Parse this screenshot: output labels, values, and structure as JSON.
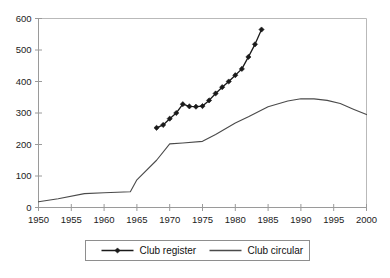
{
  "chart_data": {
    "type": "line",
    "title": "",
    "subtitle": "",
    "xlabel": "",
    "ylabel": "",
    "xlim": [
      1950,
      2000
    ],
    "ylim": [
      0,
      600
    ],
    "grid": false,
    "legend_position": "bottom",
    "x_ticks": [
      "1950",
      "1955",
      "1960",
      "1965",
      "1970",
      "1975",
      "1980",
      "1985",
      "1990",
      "1995",
      "2000"
    ],
    "x_tick_values": [
      1950,
      1955,
      1960,
      1965,
      1970,
      1975,
      1980,
      1985,
      1990,
      1995,
      2000
    ],
    "y_ticks": [
      "0",
      "100",
      "200",
      "300",
      "400",
      "500",
      "600"
    ],
    "y_tick_values": [
      0,
      100,
      200,
      300,
      400,
      500,
      600
    ],
    "series": [
      {
        "name": "Club register",
        "marker": "diamond",
        "color": "#1a1a1a",
        "x": [
          1968,
          1969,
          1970,
          1971,
          1972,
          1973,
          1974,
          1975,
          1976,
          1977,
          1978,
          1979,
          1980,
          1981,
          1982,
          1983,
          1984
        ],
        "values": [
          253,
          262,
          282,
          300,
          328,
          321,
          320,
          322,
          340,
          362,
          382,
          400,
          420,
          440,
          478,
          518,
          565
        ]
      },
      {
        "name": "Club circular",
        "marker": "none",
        "color": "#4a4a4a",
        "x": [
          1950,
          1953,
          1957,
          1960,
          1964,
          1965,
          1968,
          1970,
          1972,
          1975,
          1977,
          1980,
          1982,
          1985,
          1988,
          1990,
          1992,
          1994,
          1996,
          1998,
          2000
        ],
        "values": [
          18,
          28,
          44,
          47,
          50,
          88,
          150,
          202,
          205,
          210,
          232,
          268,
          288,
          320,
          338,
          345,
          345,
          340,
          330,
          312,
          295
        ]
      }
    ]
  },
  "legend": {
    "items": [
      {
        "label": "Club register",
        "marker": "diamond"
      },
      {
        "label": "Club circular",
        "marker": "none"
      }
    ]
  },
  "caption": {
    "text": ""
  }
}
